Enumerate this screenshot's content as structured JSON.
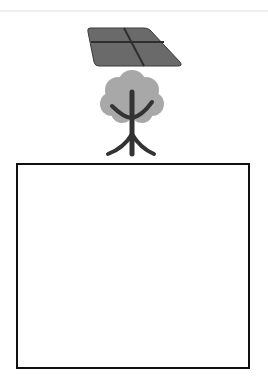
{
  "scene": {
    "background": "#ffffff",
    "items": [
      {
        "id": "solar-panel",
        "icon": "solar-panel-icon",
        "fill": "#6a6a6a",
        "grid": "#2e2e2e"
      },
      {
        "id": "tree",
        "icon": "tree-icon",
        "canopy": "#a8a8a8",
        "trunk": "#333333"
      }
    ],
    "box": {
      "border_color": "#111111",
      "fill": "#ffffff",
      "content": ""
    }
  }
}
